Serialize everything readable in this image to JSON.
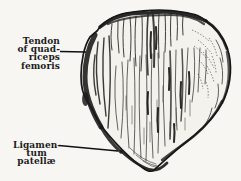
{
  "page": {
    "background": "#f7f6f2",
    "ink": "#1c1c1c"
  },
  "figure": {
    "labels": {
      "tendon": {
        "lines": [
          "Tendon",
          "of quad-",
          "riceps",
          "femoris"
        ]
      },
      "ligament": {
        "lines": [
          "Ligamen-",
          "tum",
          "patellæ"
        ]
      }
    }
  }
}
